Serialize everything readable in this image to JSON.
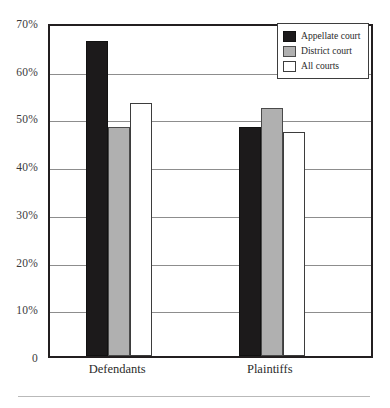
{
  "chart_data": {
    "type": "bar",
    "title": "",
    "subtitle": "",
    "xlabel": "",
    "ylabel": "",
    "categories": [
      "Defendants",
      "Plaintiffs"
    ],
    "series": [
      {
        "name": "Appellate court",
        "values": [
          66,
          48
        ],
        "color": "#1c1a1b"
      },
      {
        "name": "District court",
        "values": [
          48,
          52
        ],
        "color": "#b0b0b0"
      },
      {
        "name": "All courts",
        "values": [
          53,
          47
        ],
        "color": "#ffffff"
      }
    ],
    "ylim": [
      0,
      70
    ],
    "y_ticks": [
      0,
      10,
      20,
      30,
      40,
      50,
      60,
      70
    ],
    "y_tick_labels": [
      "0",
      "10%",
      "20%",
      "30%",
      "40%",
      "50%",
      "60%",
      "70%"
    ],
    "grid": "horizontal",
    "legend_position": "top-right",
    "annotations": []
  },
  "legend": {
    "items": [
      {
        "label": "Appellate court",
        "swatch": "black-swatch"
      },
      {
        "label": "District court",
        "swatch": "gray-swatch"
      },
      {
        "label": "All courts",
        "swatch": "white-swatch"
      }
    ]
  },
  "axes": {
    "y_tick_labels": [
      "70%",
      "60%",
      "50%",
      "40%",
      "30%",
      "20%",
      "10%",
      "0"
    ],
    "x_tick_labels": [
      "Defendants",
      "Plaintiffs"
    ]
  }
}
